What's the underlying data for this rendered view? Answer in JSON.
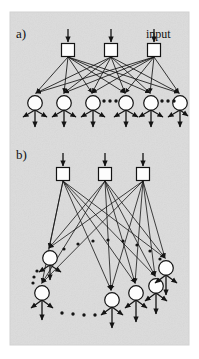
{
  "figure": {
    "kind": "diagram",
    "caption_labels": {
      "panel_a": "a)",
      "panel_b": "b)"
    },
    "annotations": {
      "input_label": "input"
    },
    "colors": {
      "background_page": "#ffffff",
      "background_figure": "#e3e3e3",
      "stroke": "#1a1a1a",
      "node_fill": "#ffffff",
      "text": "#111111"
    },
    "frame": {
      "x": 10,
      "y": 12,
      "width": 179,
      "height": 333
    }
  },
  "panel_a": {
    "label": "a)",
    "description": "Fully connected feedforward layer: three input units fan out to six hidden units, each hidden unit emits three output arrows.",
    "input_nodes": [
      {
        "id": "a-in-1",
        "shape": "square",
        "cx": 68,
        "cy": 50
      },
      {
        "id": "a-in-2",
        "shape": "square",
        "cx": 111,
        "cy": 50
      },
      {
        "id": "a-in-3",
        "shape": "square",
        "cx": 154,
        "cy": 50
      }
    ],
    "unit_nodes": [
      {
        "id": "a-u-1",
        "shape": "circle",
        "cx": 35,
        "cy": 103
      },
      {
        "id": "a-u-2",
        "shape": "circle",
        "cx": 64,
        "cy": 103
      },
      {
        "id": "a-u-3",
        "shape": "circle",
        "cx": 93,
        "cy": 103
      },
      {
        "id": "a-u-4",
        "shape": "circle",
        "cx": 126,
        "cy": 103
      },
      {
        "id": "a-u-5",
        "shape": "circle",
        "cx": 151,
        "cy": 103
      },
      {
        "id": "a-u-6",
        "shape": "circle",
        "cx": 180,
        "cy": 103
      }
    ],
    "ellipses": [
      {
        "id": "a-ellipsis-1",
        "cx": 109,
        "cy": 101,
        "count": 3,
        "orientation": "horizontal"
      },
      {
        "id": "a-ellipsis-2",
        "cx": 167,
        "cy": 101,
        "count": 3,
        "orientation": "horizontal"
      }
    ],
    "input_arrow_length": 17,
    "square_size": 13,
    "circle_radius": 7.5
  },
  "panel_b": {
    "label": "b)",
    "description": "Sparsely/topographically connected layer: three input units project to units arranged along a curved arc.",
    "input_nodes": [
      {
        "id": "b-in-1",
        "shape": "square",
        "cx": 63,
        "cy": 174
      },
      {
        "id": "b-in-2",
        "shape": "square",
        "cx": 105,
        "cy": 174
      },
      {
        "id": "b-in-3",
        "shape": "square",
        "cx": 143,
        "cy": 174
      }
    ],
    "unit_nodes": [
      {
        "id": "b-u-1",
        "shape": "circle",
        "cx": 50,
        "cy": 258
      },
      {
        "id": "b-u-2",
        "shape": "circle",
        "cx": 42,
        "cy": 293
      },
      {
        "id": "b-u-3",
        "shape": "circle",
        "cx": 112,
        "cy": 300
      },
      {
        "id": "b-u-4",
        "shape": "circle",
        "cx": 136,
        "cy": 293
      },
      {
        "id": "b-u-5",
        "shape": "circle",
        "cx": 156,
        "cy": 286
      },
      {
        "id": "b-u-6",
        "shape": "circle",
        "cx": 166,
        "cy": 268
      }
    ],
    "ellipses": [
      {
        "id": "b-ellipsis-arc",
        "orientation": "arc",
        "count": 8
      },
      {
        "id": "b-ellipsis-left",
        "orientation": "diagonal",
        "count": 4
      },
      {
        "id": "b-ellipsis-bottom",
        "orientation": "horizontal",
        "count": 5
      }
    ],
    "input_arrow_length": 17,
    "square_size": 13,
    "circle_radius": 7.5
  }
}
